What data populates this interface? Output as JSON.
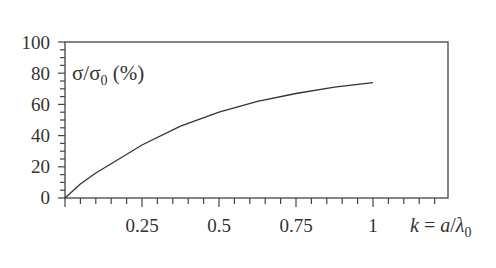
{
  "chart_data": {
    "type": "line",
    "title": "",
    "xlabel": "k = a/λ0",
    "ylabel": "σ/σ0 (%)",
    "xlim": [
      0,
      1.24
    ],
    "ylim": [
      0,
      100
    ],
    "x_ticks": [
      "0.25",
      "0.5",
      "0.75",
      "1"
    ],
    "y_ticks": [
      "0",
      "20",
      "40",
      "60",
      "80",
      "100"
    ],
    "grid": false,
    "legend": null,
    "series": [
      {
        "name": "σ/σ0",
        "x": [
          0,
          0.05,
          0.1,
          0.15,
          0.25,
          0.375,
          0.5,
          0.625,
          0.75,
          0.875,
          1.0
        ],
        "y": [
          0,
          9,
          16,
          22,
          34,
          46,
          55,
          62,
          67,
          71,
          74
        ]
      }
    ]
  },
  "axes": {
    "y_tick_labels": [
      "100",
      "80",
      "60",
      "40",
      "20",
      "0"
    ],
    "x_tick_labels": [
      "0.25",
      "0.5",
      "0.75",
      "1"
    ],
    "ylabel_main": "σ/σ",
    "ylabel_sub": "0",
    "ylabel_unit": " (%)",
    "xlabel_k": "k",
    "xlabel_eq": " = ",
    "xlabel_a": "a",
    "xlabel_slash": "/",
    "xlabel_lambda": "λ",
    "xlabel_sub": "0"
  }
}
